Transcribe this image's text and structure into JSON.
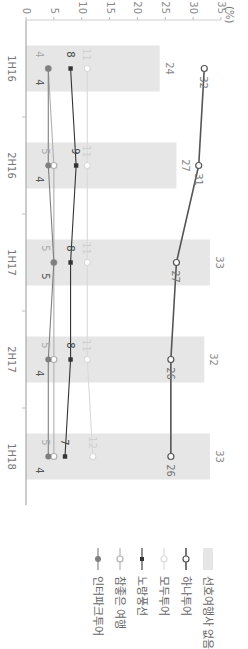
{
  "chart_data": {
    "type": "bar+line",
    "orientation_note": "figure rendered rotated 90 degrees clockwise",
    "title": "",
    "xlabel": "",
    "ylabel": "(%)",
    "ylim": [
      0,
      35
    ],
    "yticks": [
      0,
      5,
      10,
      15,
      20,
      25,
      30,
      35
    ],
    "categories": [
      "1H16",
      "2H16",
      "1H17",
      "2H17",
      "1H18"
    ],
    "grid": false,
    "legend_position": "right",
    "series": [
      {
        "name": "선호여행사 없음",
        "kind": "bar",
        "color": "#e6e6e6",
        "values": [
          24,
          27,
          33,
          32,
          33
        ]
      },
      {
        "name": "하나투어",
        "kind": "line",
        "marker": "open-circle",
        "color": "#555555",
        "values": [
          32,
          31,
          27,
          26,
          26
        ]
      },
      {
        "name": "모두투어",
        "kind": "line",
        "marker": "open-circle",
        "color": "#d9d9d9",
        "values": [
          11,
          11,
          11,
          11,
          12
        ]
      },
      {
        "name": "노랑풍선",
        "kind": "line",
        "marker": "filled-square",
        "color": "#333333",
        "values": [
          8,
          9,
          8,
          8,
          7
        ]
      },
      {
        "name": "참좋은 여행",
        "kind": "line",
        "marker": "open-circle",
        "color": "#b0b0b0",
        "values": [
          4,
          5,
          5,
          5,
          5
        ]
      },
      {
        "name": "인터파크투어",
        "kind": "line",
        "marker": "filled-circle",
        "color": "#7f7f7f",
        "values": [
          4,
          4,
          5,
          4,
          4
        ]
      }
    ]
  },
  "axis": {
    "unit_label": "(%)"
  },
  "legend": {
    "items": [
      {
        "label": "선호여행사 없음"
      },
      {
        "label": "하나투어"
      },
      {
        "label": "모두투어"
      },
      {
        "label": "노랑풍선"
      },
      {
        "label": "참좋은 여행"
      },
      {
        "label": "인터파크투어"
      }
    ]
  }
}
